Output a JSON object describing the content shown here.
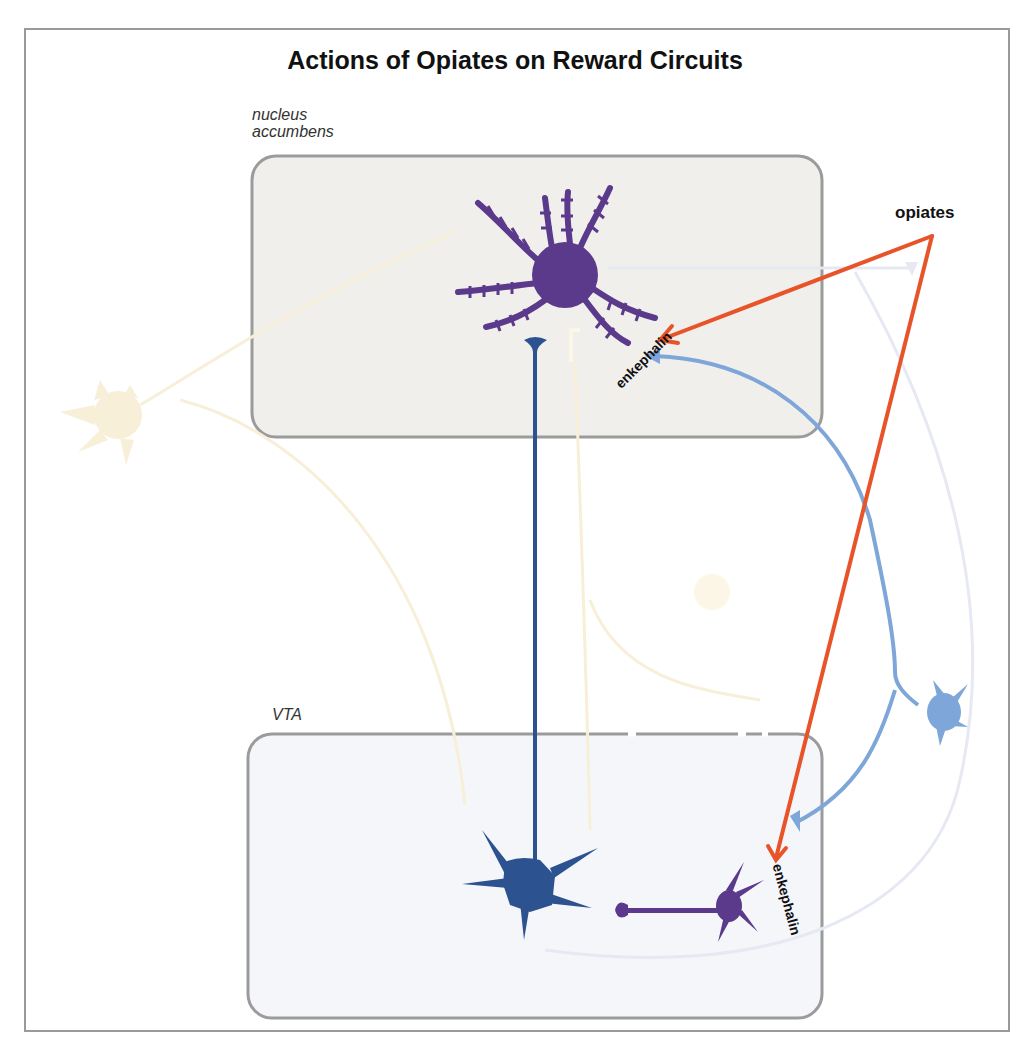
{
  "title": "Actions of Opiates on Reward Circuits",
  "regions": {
    "nucleus_accumbens": {
      "label_line1": "nucleus",
      "label_line2": "accumbens",
      "fill": "#f1efec",
      "border": "#9b9b9b"
    },
    "vta": {
      "label": "VTA",
      "fill": "#f5f6fa",
      "border": "#9b9b9b"
    }
  },
  "labels": {
    "opiates": "opiates",
    "enkephalin_nac": "enkephalin",
    "enkephalin_vta": "enkephalin"
  },
  "colors": {
    "opiate_arrow": "#e8542a",
    "medium_spiny_neuron": "#5b3a8c",
    "dopamine_neuron": "#2c5290",
    "gaba_interneuron": "#5b3a8c",
    "enkephalin_neuron": "#7ea6d8",
    "faded_yellow": "#f8efd9",
    "faded_blue": "#e6e9f4"
  },
  "neurons": [
    {
      "name": "medium-spiny-neuron",
      "region": "nucleus accumbens"
    },
    {
      "name": "dopamine-neuron",
      "region": "VTA"
    },
    {
      "name": "gaba-interneuron",
      "region": "VTA"
    },
    {
      "name": "enkephalin-neuron",
      "region": "between regions"
    }
  ]
}
